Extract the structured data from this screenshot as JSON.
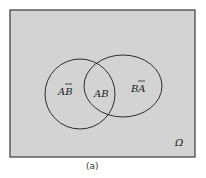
{
  "diagram": {
    "type": "venn",
    "universe_label": "Ω",
    "caption": "(a)",
    "colors": {
      "universe_fill": "#d3d3d3",
      "stroke": "#3a3a3a",
      "background": "#ffffff"
    },
    "regions": [
      {
        "id": "a-not-b",
        "base": "A",
        "bar": "B"
      },
      {
        "id": "a-and-b",
        "text": "AB"
      },
      {
        "id": "b-not-a",
        "base": "B",
        "bar": "A"
      }
    ]
  }
}
